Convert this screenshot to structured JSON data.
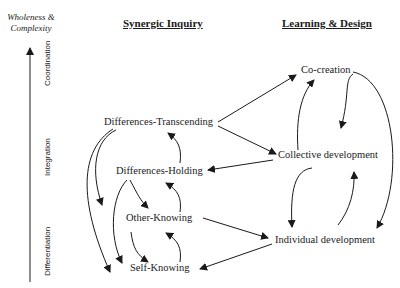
{
  "axis": {
    "title_line1": "Wholeness &",
    "title_line2": "Complexity",
    "levels": [
      "Coordination",
      "Integration",
      "Differentiation"
    ]
  },
  "columns": {
    "left_heading": "Synergic Inquiry",
    "right_heading": "Learning & Design"
  },
  "nodes": {
    "left": [
      "Differences-Transcending",
      "Differences-Holding",
      "Other-Knowing",
      "Self-Knowing"
    ],
    "right": [
      "Co-creation",
      "Collective development",
      "Individual development"
    ]
  },
  "colors": {
    "line": "#1a1a1a",
    "background": "#ffffff"
  }
}
